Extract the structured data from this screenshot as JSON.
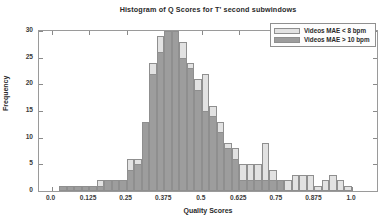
{
  "chart_data": {
    "type": "bar",
    "title": "Histogram of Q Scores for T' second subwindows",
    "xlabel": "Quality Scores",
    "ylabel": "Frequency",
    "xlim": [
      -0.0417,
      1.0833
    ],
    "ylim": [
      0,
      30
    ],
    "grid": false,
    "legend_position": "top-right",
    "bin_width": 0.025,
    "xticks": [
      "0.0",
      "0.125",
      "0.25",
      "0.375",
      "0.5",
      "0.625",
      "0.75",
      "0.875",
      "1.0"
    ],
    "xtick_values": [
      0.0,
      0.125,
      0.25,
      0.375,
      0.5,
      0.625,
      0.75,
      0.875,
      1.0
    ],
    "yticks": [
      "0",
      "5",
      "10",
      "15",
      "20",
      "25",
      "30"
    ],
    "ytick_values": [
      0,
      5,
      10,
      15,
      20,
      25,
      30
    ],
    "bin_centers": [
      0.0375,
      0.0625,
      0.0875,
      0.1125,
      0.1375,
      0.1625,
      0.1875,
      0.2125,
      0.2375,
      0.2625,
      0.2875,
      0.3125,
      0.3375,
      0.3625,
      0.3875,
      0.4125,
      0.4375,
      0.4625,
      0.4875,
      0.5125,
      0.5375,
      0.5625,
      0.5875,
      0.6125,
      0.6375,
      0.6625,
      0.6875,
      0.7125,
      0.7375,
      0.7625,
      0.7875,
      0.8125,
      0.8375,
      0.8625,
      0.8875,
      0.9125,
      0.9375,
      0.9625,
      0.9875,
      1.0125
    ],
    "series": [
      {
        "name": "Videos MAE < 8 bpm",
        "color": "#e2e2e2",
        "values": [
          0,
          1,
          1,
          1,
          1,
          2,
          2,
          2,
          2,
          6,
          6,
          5,
          24,
          29,
          30,
          30,
          28,
          24,
          21,
          22,
          16,
          13,
          9,
          8,
          5,
          5,
          5,
          9,
          4,
          2,
          2,
          3,
          3,
          3,
          1,
          2,
          3,
          2,
          1,
          0
        ]
      },
      {
        "name": "Videos MAE > 10 bpm",
        "color": "#9d9d9d",
        "values": [
          1,
          1,
          1,
          1,
          1,
          1,
          2,
          2,
          2,
          4,
          5,
          13,
          22,
          26,
          30,
          30,
          25,
          23,
          19,
          15,
          14,
          11,
          8,
          6,
          2,
          2,
          2,
          2,
          2,
          2,
          0,
          0,
          0,
          0,
          0,
          0,
          0,
          0,
          0,
          0
        ]
      }
    ]
  },
  "legend": {
    "items": [
      {
        "label": "Videos MAE < 8 bpm"
      },
      {
        "label": "Videos MAE > 10 bpm"
      }
    ]
  }
}
